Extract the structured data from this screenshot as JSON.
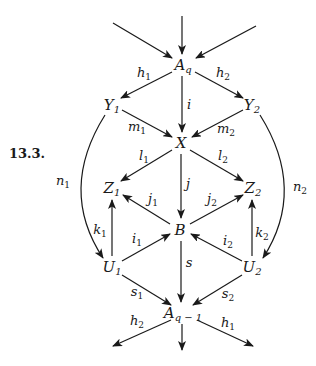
{
  "figure": {
    "number": "13.3.",
    "number_pos": [
      27,
      153
    ]
  },
  "nodes": [
    {
      "id": "Aq",
      "base": "A",
      "sub": "q",
      "x": 183,
      "y": 66
    },
    {
      "id": "Y1",
      "base": "Y",
      "sub": "1",
      "x": 112,
      "y": 106
    },
    {
      "id": "Y2",
      "base": "Y",
      "sub": "2",
      "x": 252,
      "y": 106
    },
    {
      "id": "X",
      "base": "X",
      "sub": "",
      "x": 181,
      "y": 143
    },
    {
      "id": "Z1",
      "base": "Z",
      "sub": "1",
      "x": 112,
      "y": 189
    },
    {
      "id": "Z2",
      "base": "Z",
      "sub": "2",
      "x": 253,
      "y": 189
    },
    {
      "id": "B",
      "base": "B",
      "sub": "",
      "x": 180,
      "y": 230
    },
    {
      "id": "U1",
      "base": "U",
      "sub": "1",
      "x": 112,
      "y": 268
    },
    {
      "id": "U2",
      "base": "U",
      "sub": "2",
      "x": 252,
      "y": 268
    },
    {
      "id": "Aq1",
      "base": "A",
      "sub": "q − 1",
      "x": 183,
      "y": 314
    }
  ],
  "edges": [
    {
      "from": [
        113,
        23
      ],
      "to": [
        172,
        58
      ],
      "label": "",
      "sub": ""
    },
    {
      "from": [
        182,
        16
      ],
      "to": [
        182,
        54
      ],
      "label": "",
      "sub": ""
    },
    {
      "from": [
        256,
        26
      ],
      "to": [
        196,
        58
      ],
      "label": "",
      "sub": ""
    },
    {
      "from": [
        172,
        72
      ],
      "to": [
        121,
        98
      ],
      "label": "h",
      "sub": "1",
      "lx": 144,
      "ly": 74
    },
    {
      "from": [
        195,
        72
      ],
      "to": [
        243,
        98
      ],
      "label": "h",
      "sub": "2",
      "lx": 223,
      "ly": 74
    },
    {
      "from": [
        182,
        76
      ],
      "to": [
        182,
        132
      ],
      "label": "i",
      "sub": "",
      "lx": 189,
      "ly": 104
    },
    {
      "from": [
        122,
        110
      ],
      "to": [
        172,
        137
      ],
      "label": "m",
      "sub": "1",
      "lx": 137,
      "ly": 128
    },
    {
      "from": [
        243,
        110
      ],
      "to": [
        192,
        137
      ],
      "label": "m",
      "sub": "2",
      "lx": 226,
      "ly": 130
    },
    {
      "from": [
        172,
        150
      ],
      "to": [
        121,
        181
      ],
      "label": "l",
      "sub": "1",
      "lx": 144,
      "ly": 157
    },
    {
      "from": [
        190,
        150
      ],
      "to": [
        243,
        181
      ],
      "label": "l",
      "sub": "2",
      "lx": 223,
      "ly": 157
    },
    {
      "from": [
        181,
        154
      ],
      "to": [
        181,
        218
      ],
      "label": "j",
      "sub": "",
      "lx": 188,
      "ly": 183
    },
    {
      "from": [
        170,
        224
      ],
      "to": [
        123,
        195
      ],
      "label": "j",
      "sub": "1",
      "lx": 153,
      "ly": 200
    },
    {
      "from": [
        190,
        224
      ],
      "to": [
        243,
        195
      ],
      "label": "j",
      "sub": "2",
      "lx": 212,
      "ly": 200
    },
    {
      "from": [
        112,
        256
      ],
      "to": [
        112,
        200
      ],
      "label": "k",
      "sub": "1",
      "lx": 100,
      "ly": 231
    },
    {
      "from": [
        252,
        256
      ],
      "to": [
        252,
        200
      ],
      "label": "k",
      "sub": "2",
      "lx": 262,
      "ly": 234
    },
    {
      "from": [
        122,
        261
      ],
      "to": [
        170,
        234
      ],
      "label": "i",
      "sub": "1",
      "lx": 137,
      "ly": 240
    },
    {
      "from": [
        242,
        261
      ],
      "to": [
        191,
        234
      ],
      "label": "i",
      "sub": "2",
      "lx": 228,
      "ly": 242
    },
    {
      "from": [
        181,
        241
      ],
      "to": [
        181,
        302
      ],
      "label": "s",
      "sub": "",
      "lx": 189,
      "ly": 262
    },
    {
      "from": [
        122,
        275
      ],
      "to": [
        171,
        305
      ],
      "label": "s",
      "sub": "1",
      "lx": 137,
      "ly": 293
    },
    {
      "from": [
        242,
        275
      ],
      "to": [
        193,
        305
      ],
      "label": "s",
      "sub": "2",
      "lx": 228,
      "ly": 295
    },
    {
      "from": [
        171,
        320
      ],
      "to": [
        113,
        346
      ],
      "label": "h",
      "sub": "2",
      "lx": 137,
      "ly": 322
    },
    {
      "from": [
        182,
        324
      ],
      "to": [
        182,
        350
      ],
      "label": "",
      "sub": ""
    },
    {
      "from": [
        197,
        320
      ],
      "to": [
        253,
        346
      ],
      "label": "h",
      "sub": "1",
      "lx": 228,
      "ly": 324
    }
  ],
  "curves": [
    {
      "id": "n1",
      "path": "M 105 115 Q 58 190 103 258",
      "arrow_at": [
        103,
        258
      ],
      "arrow_dir": [
        0.55,
        1
      ],
      "label": "n",
      "sub": "1",
      "lx": 63,
      "ly": 182
    },
    {
      "id": "n2",
      "path": "M 260 115 Q 307 190 263 258",
      "arrow_at": [
        263,
        258
      ],
      "arrow_dir": [
        -0.55,
        1
      ],
      "label": "n",
      "sub": "2",
      "lx": 300,
      "ly": 188
    }
  ],
  "style": {
    "stroke": "#1a1a1a",
    "background": "#ffffff"
  }
}
